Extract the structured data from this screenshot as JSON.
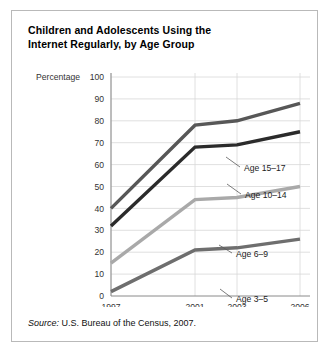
{
  "figure": {
    "title_line1": "Children and Adolescents Using the",
    "title_line2": "Internet Regularly, by Age Group",
    "source_label": "Source:",
    "source_text": " U.S. Bureau of the Census, 2007."
  },
  "chart_data": {
    "type": "line",
    "title": "Children and Adolescents Using the Internet Regularly, by Age Group",
    "xlabel": "Year",
    "ylabel": "Percentage",
    "categories": [
      "1997",
      "2001",
      "2003",
      "2006"
    ],
    "x": [
      1997,
      2001,
      2003,
      2006
    ],
    "xticklabels": [
      "1997",
      "2001",
      "2003",
      "2006"
    ],
    "yticks": [
      0,
      10,
      20,
      30,
      40,
      50,
      60,
      70,
      80,
      90,
      100
    ],
    "yticklabels": [
      "0",
      "10",
      "20",
      "30",
      "40",
      "50",
      "60",
      "70",
      "80",
      "90",
      "100"
    ],
    "ylim": [
      0,
      100
    ],
    "grid": true,
    "legend": "inline-labels",
    "series": [
      {
        "name": "Age 15–17",
        "values": [
          40,
          78,
          80,
          88
        ],
        "color": "#575757",
        "label_x": 232,
        "label_y": 114,
        "leader_from_x": 228,
        "leader_from_y": 110,
        "leader_to_x": 214,
        "leader_to_y": 100
      },
      {
        "name": "Age 10–14",
        "values": [
          32,
          68,
          69,
          75
        ],
        "color": "#2b2b2b",
        "label_x": 233,
        "label_y": 141,
        "leader_from_x": 229,
        "leader_from_y": 137,
        "leader_to_x": 215,
        "leader_to_y": 127
      },
      {
        "name": "Age 6–9",
        "values": [
          15,
          44,
          45,
          50
        ],
        "color": "#a9a9a9",
        "label_x": 224,
        "label_y": 200,
        "leader_from_x": 220,
        "leader_from_y": 196,
        "leader_to_x": 207,
        "leader_to_y": 188
      },
      {
        "name": "Age 3–5",
        "values": [
          2,
          21,
          22,
          26
        ],
        "color": "#6e6e6e",
        "label_x": 224,
        "label_y": 245,
        "leader_from_x": 220,
        "leader_from_y": 241,
        "leader_to_x": 208,
        "leader_to_y": 232
      }
    ]
  },
  "colors": {
    "grid": "#d8d8d8",
    "axis": "#8a8a8a",
    "frame_border": "#b9b9b9",
    "text": "#333333"
  }
}
